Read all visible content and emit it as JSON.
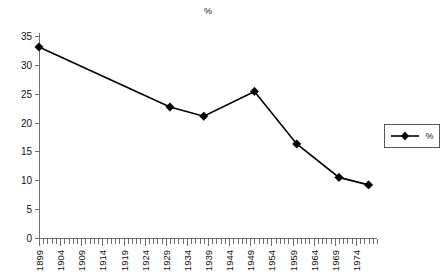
{
  "chart_data": {
    "type": "line",
    "title": "%",
    "xlabel": "",
    "ylabel": "",
    "ylim": [
      0,
      35
    ],
    "xlim": [
      1899,
      1979
    ],
    "grid": false,
    "legend_position": "right",
    "legend": [
      "%"
    ],
    "y_ticks": [
      0,
      5,
      10,
      15,
      20,
      25,
      30,
      35
    ],
    "x_tick_labels": [
      "1899",
      "1904",
      "1909",
      "1914",
      "1919",
      "1924",
      "1929",
      "1934",
      "1939",
      "1944",
      "1949",
      "1954",
      "1959",
      "1964",
      "1969",
      "1974"
    ],
    "x_tick_values": [
      1899,
      1904,
      1909,
      1914,
      1919,
      1924,
      1929,
      1934,
      1939,
      1944,
      1949,
      1954,
      1959,
      1964,
      1969,
      1974
    ],
    "x_minor_tick_step": 1,
    "series": [
      {
        "name": "%",
        "marker": "diamond",
        "color": "#000000",
        "x": [
          1899,
          1930,
          1938,
          1950,
          1960,
          1970,
          1977
        ],
        "values": [
          33.1,
          22.7,
          21.1,
          25.4,
          16.3,
          10.5,
          9.2
        ]
      }
    ]
  },
  "legend": {
    "label": "%"
  },
  "axis": {
    "y_axis_name": "value-axis",
    "x_axis_name": "year-axis"
  }
}
